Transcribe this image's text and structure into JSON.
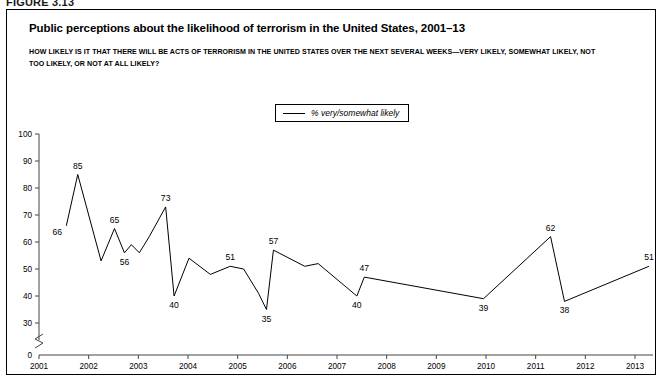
{
  "figure": {
    "label": "FIGURE 3.13",
    "title": "Public perceptions about the likelihood of terrorism in the United States, 2001–13",
    "subtitle": "HOW LIKELY IS IT THAT THERE WILL BE ACTS OF TERRORISM IN THE UNITED STATES OVER THE NEXT SEVERAL WEEKS—VERY LIKELY, SOMEWHAT LIKELY, NOT TOO LIKELY, OR NOT AT ALL LIKELY?"
  },
  "legend": {
    "position": "top-center",
    "entries": [
      {
        "marker": "line-swatch",
        "label": "% very/somewhat likely",
        "color": "#000000"
      }
    ]
  },
  "chart_data": {
    "type": "line",
    "title": "Public perceptions about the likelihood of terrorism in the United States, 2001–13",
    "subtitle": "HOW LIKELY IS IT THAT THERE WILL BE ACTS OF TERRORISM IN THE UNITED STATES OVER THE NEXT SEVERAL WEEKS—VERY LIKELY, SOMEWHAT LIKELY, NOT TOO LIKELY, OR NOT AT ALL LIKELY?",
    "xlabel": "",
    "ylabel": "",
    "ylim": [
      30,
      100
    ],
    "yticks": [
      30,
      40,
      50,
      60,
      70,
      80,
      90,
      100
    ],
    "y_axis_break": true,
    "y_axis_origin_label": "0",
    "xlim": [
      2001,
      2013.6
    ],
    "xticks": [
      2001,
      2002,
      2003,
      2004,
      2005,
      2006,
      2007,
      2008,
      2009,
      2010,
      2011,
      2012,
      2013
    ],
    "xtick_labels": [
      "2001",
      "2002",
      "2003",
      "2004",
      "2005",
      "2006",
      "2007",
      "2008",
      "2009",
      "2010",
      "2011",
      "2012",
      "2013"
    ],
    "grid": false,
    "legend_position": "top-center",
    "series": [
      {
        "name": "% very/somewhat likely",
        "color": "#000000",
        "x": [
          2001.55,
          2001.78,
          2002.25,
          2002.52,
          2002.72,
          2002.86,
          2003.02,
          2003.22,
          2003.55,
          2003.72,
          2004.02,
          2004.45,
          2004.85,
          2005.12,
          2005.42,
          2005.58,
          2005.72,
          2006.35,
          2006.62,
          2007.4,
          2007.55,
          2009.95,
          2011.3,
          2011.58,
          2013.28
        ],
        "y": [
          66,
          85,
          53,
          65,
          56,
          59,
          56,
          62,
          73,
          40,
          54,
          48,
          51,
          50,
          41,
          35,
          57,
          51,
          52,
          40,
          47,
          39,
          62,
          38,
          51
        ],
        "labeled_points": [
          {
            "x": 2001.55,
            "y": 66,
            "label": "66",
            "placement": "below-left"
          },
          {
            "x": 2001.78,
            "y": 85,
            "label": "85",
            "placement": "above"
          },
          {
            "x": 2002.52,
            "y": 65,
            "label": "65",
            "placement": "above"
          },
          {
            "x": 2002.72,
            "y": 56,
            "label": "56",
            "placement": "below"
          },
          {
            "x": 2003.55,
            "y": 73,
            "label": "73",
            "placement": "above"
          },
          {
            "x": 2003.72,
            "y": 40,
            "label": "40",
            "placement": "below"
          },
          {
            "x": 2004.85,
            "y": 51,
            "label": "51",
            "placement": "above"
          },
          {
            "x": 2005.58,
            "y": 35,
            "label": "35",
            "placement": "below"
          },
          {
            "x": 2005.72,
            "y": 57,
            "label": "57",
            "placement": "above"
          },
          {
            "x": 2007.4,
            "y": 40,
            "label": "40",
            "placement": "below"
          },
          {
            "x": 2007.55,
            "y": 47,
            "label": "47",
            "placement": "above"
          },
          {
            "x": 2009.95,
            "y": 39,
            "label": "39",
            "placement": "below"
          },
          {
            "x": 2011.3,
            "y": 62,
            "label": "62",
            "placement": "above"
          },
          {
            "x": 2011.58,
            "y": 38,
            "label": "38",
            "placement": "below"
          },
          {
            "x": 2013.28,
            "y": 51,
            "label": "51",
            "placement": "above"
          }
        ]
      }
    ]
  }
}
